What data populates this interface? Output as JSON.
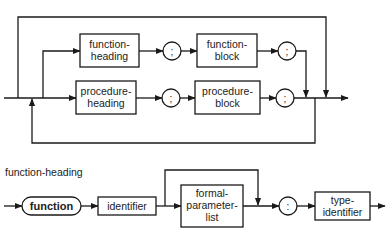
{
  "diagram_top": {
    "nodes": {
      "function_heading": [
        "function-",
        "heading"
      ],
      "function_block": [
        "function-",
        "block"
      ],
      "procedure_heading": [
        "procedure-",
        "heading"
      ],
      "procedure_block": [
        "procedure-",
        "block"
      ],
      "sep1": ";",
      "sep2": ";",
      "sep3": ";",
      "sep4": ";"
    }
  },
  "diagram_bottom": {
    "title": "function-heading",
    "nodes": {
      "keyword_function": "function",
      "identifier": "identifier",
      "formal_parameter_list": [
        "formal-",
        "parameter-",
        "list"
      ],
      "colon": ":",
      "type_identifier": [
        "type-",
        "identifier"
      ]
    }
  },
  "colors": {
    "line": "#1a1a1a",
    "background": "#ffffff"
  }
}
